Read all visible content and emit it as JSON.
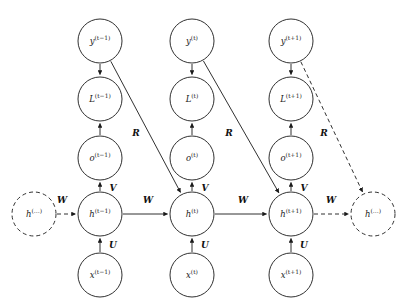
{
  "diagram": {
    "stroke_color": "#1a1a1a",
    "background_color": "#ffffff",
    "nodes": [
      {
        "id": "h_prev_ellipsis",
        "base": "h",
        "sup": "(…)",
        "cx": 34,
        "cy": 214,
        "r": 22,
        "style": "dashed"
      },
      {
        "id": "h_tm1",
        "base": "h",
        "sup": "(t−1)",
        "cx": 100,
        "cy": 214,
        "r": 22,
        "style": "solid"
      },
      {
        "id": "h_t",
        "base": "h",
        "sup": "(t)",
        "cx": 192,
        "cy": 214,
        "r": 22,
        "style": "solid"
      },
      {
        "id": "h_tp1",
        "base": "h",
        "sup": "(t+1)",
        "cx": 291,
        "cy": 214,
        "r": 22,
        "style": "solid"
      },
      {
        "id": "h_next_ellipsis",
        "base": "h",
        "sup": "(…)",
        "cx": 373,
        "cy": 214,
        "r": 22,
        "style": "dashed"
      },
      {
        "id": "x_tm1",
        "base": "x",
        "sup": "(t−1)",
        "cx": 100,
        "cy": 275,
        "r": 22,
        "style": "solid"
      },
      {
        "id": "x_t",
        "base": "x",
        "sup": "(t)",
        "cx": 192,
        "cy": 275,
        "r": 22,
        "style": "solid"
      },
      {
        "id": "x_tp1",
        "base": "x",
        "sup": "(t+1)",
        "cx": 291,
        "cy": 275,
        "r": 22,
        "style": "solid"
      },
      {
        "id": "o_tm1",
        "base": "o",
        "sup": "(t−1)",
        "cx": 100,
        "cy": 158,
        "r": 22,
        "style": "solid"
      },
      {
        "id": "o_t",
        "base": "o",
        "sup": "(t)",
        "cx": 192,
        "cy": 158,
        "r": 22,
        "style": "solid"
      },
      {
        "id": "o_tp1",
        "base": "o",
        "sup": "(t+1)",
        "cx": 291,
        "cy": 158,
        "r": 22,
        "style": "solid"
      },
      {
        "id": "L_tm1",
        "base": "L",
        "sup": "(t−1)",
        "cx": 100,
        "cy": 99,
        "r": 22,
        "style": "solid"
      },
      {
        "id": "L_t",
        "base": "L",
        "sup": "(t)",
        "cx": 192,
        "cy": 99,
        "r": 22,
        "style": "solid"
      },
      {
        "id": "L_tp1",
        "base": "L",
        "sup": "(t+1)",
        "cx": 291,
        "cy": 99,
        "r": 22,
        "style": "solid"
      },
      {
        "id": "y_tm1",
        "base": "y",
        "sup": "(t−1)",
        "cx": 100,
        "cy": 41,
        "r": 22,
        "style": "solid"
      },
      {
        "id": "y_t",
        "base": "y",
        "sup": "(t)",
        "cx": 192,
        "cy": 41,
        "r": 22,
        "style": "solid"
      },
      {
        "id": "y_tp1",
        "base": "y",
        "sup": "(t+1)",
        "cx": 291,
        "cy": 41,
        "r": 22,
        "style": "solid"
      }
    ],
    "edges": [
      {
        "id": "e_hprev_htm1",
        "from": "h_prev_ellipsis",
        "to": "h_tm1",
        "style": "dashed",
        "weight": "W"
      },
      {
        "id": "e_htm1_ht",
        "from": "h_tm1",
        "to": "h_t",
        "style": "solid",
        "weight": "W"
      },
      {
        "id": "e_ht_htp1",
        "from": "h_t",
        "to": "h_tp1",
        "style": "solid",
        "weight": "W"
      },
      {
        "id": "e_htp1_hnext",
        "from": "h_tp1",
        "to": "h_next_ellipsis",
        "style": "dashed",
        "weight": "W"
      },
      {
        "id": "e_xtm1_htm1",
        "from": "x_tm1",
        "to": "h_tm1",
        "style": "solid",
        "weight": "U"
      },
      {
        "id": "e_xt_ht",
        "from": "x_t",
        "to": "h_t",
        "style": "solid",
        "weight": "U"
      },
      {
        "id": "e_xtp1_htp1",
        "from": "x_tp1",
        "to": "h_tp1",
        "style": "solid",
        "weight": "U"
      },
      {
        "id": "e_htm1_otm1",
        "from": "h_tm1",
        "to": "o_tm1",
        "style": "solid",
        "weight": "V"
      },
      {
        "id": "e_ht_ot",
        "from": "h_t",
        "to": "o_t",
        "style": "solid",
        "weight": "V"
      },
      {
        "id": "e_htp1_otp1",
        "from": "h_tp1",
        "to": "o_tp1",
        "style": "solid",
        "weight": "V"
      },
      {
        "id": "e_otm1_Ltm1",
        "from": "o_tm1",
        "to": "L_tm1",
        "style": "solid",
        "weight": ""
      },
      {
        "id": "e_ot_Lt",
        "from": "o_t",
        "to": "L_t",
        "style": "solid",
        "weight": ""
      },
      {
        "id": "e_otp1_Ltp1",
        "from": "o_tp1",
        "to": "L_tp1",
        "style": "solid",
        "weight": ""
      },
      {
        "id": "e_ytm1_Ltm1",
        "from": "y_tm1",
        "to": "L_tm1",
        "style": "solid",
        "weight": ""
      },
      {
        "id": "e_yt_Lt",
        "from": "y_t",
        "to": "L_t",
        "style": "solid",
        "weight": ""
      },
      {
        "id": "e_ytp1_Ltp1",
        "from": "y_tp1",
        "to": "L_tp1",
        "style": "solid",
        "weight": ""
      },
      {
        "id": "e_ytm1_ht",
        "from": "y_tm1",
        "to": "h_t",
        "style": "solid",
        "weight": "R"
      },
      {
        "id": "e_yt_htp1",
        "from": "y_t",
        "to": "h_tp1",
        "style": "solid",
        "weight": "R"
      },
      {
        "id": "e_ytp1_hnext",
        "from": "y_tp1",
        "to": "h_next_ellipsis",
        "style": "dashed",
        "weight": "R"
      }
    ],
    "weight_labels": [
      {
        "id": "w_left",
        "text": "W",
        "x": 62,
        "y": 200
      },
      {
        "id": "w_mid1",
        "text": "W",
        "x": 148,
        "y": 200
      },
      {
        "id": "w_mid2",
        "text": "W",
        "x": 243,
        "y": 200
      },
      {
        "id": "w_right",
        "text": "W",
        "x": 331,
        "y": 200
      },
      {
        "id": "u_left",
        "text": "U",
        "x": 113,
        "y": 245
      },
      {
        "id": "u_mid",
        "text": "U",
        "x": 205,
        "y": 245
      },
      {
        "id": "u_right",
        "text": "U",
        "x": 304,
        "y": 245
      },
      {
        "id": "v_left",
        "text": "V",
        "x": 113,
        "y": 188
      },
      {
        "id": "v_mid",
        "text": "V",
        "x": 205,
        "y": 188
      },
      {
        "id": "v_right",
        "text": "V",
        "x": 304,
        "y": 188
      },
      {
        "id": "r_left",
        "text": "R",
        "x": 136,
        "y": 133
      },
      {
        "id": "r_mid",
        "text": "R",
        "x": 229,
        "y": 133
      },
      {
        "id": "r_right",
        "text": "R",
        "x": 324,
        "y": 133
      }
    ]
  }
}
